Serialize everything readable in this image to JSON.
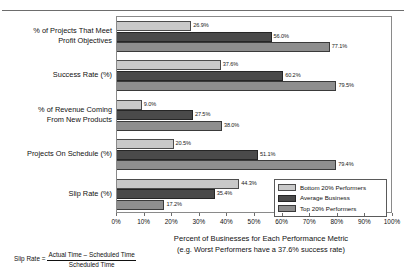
{
  "chart_data": {
    "type": "bar",
    "orientation": "horizontal",
    "title": "",
    "xlabel": "Percent of Businesses for Each Performance Metric",
    "xlabel_sub": "(e.g. Worst Performers have a 37.6% success rate)",
    "ylabel": "",
    "xlim": [
      0,
      100
    ],
    "grid": false,
    "legend_position": "inside-bottom-right",
    "categories": [
      "% of Projects That Meet\nProfit Objectives",
      "Success Rate (%)",
      "% of Revenue Coming\nFrom New Products",
      "Projects On Schedule (%)",
      "Slip Rate (%)"
    ],
    "series": [
      {
        "name": "Bottom 20% Performers",
        "color": "#c9c9c9",
        "values": [
          26.9,
          37.6,
          9.0,
          20.5,
          44.3
        ],
        "labels": [
          "26.9%",
          "37.6%",
          "9.0%",
          "20.5%",
          "44.3%"
        ]
      },
      {
        "name": "Average Business",
        "color": "#4a4a4a",
        "values": [
          56.0,
          60.2,
          27.5,
          51.1,
          35.4
        ],
        "labels": [
          "56.0%",
          "60.2%",
          "27.5%",
          "51.1%",
          "35.4%"
        ]
      },
      {
        "name": "Top 20% Performers",
        "color": "#8e8e8e",
        "values": [
          77.1,
          79.5,
          38.0,
          79.4,
          17.2
        ],
        "labels": [
          "77.1%",
          "79.5%",
          "38.0%",
          "79.4%",
          "17.2%"
        ]
      }
    ],
    "xticks": [
      0,
      10,
      20,
      30,
      40,
      50,
      60,
      70,
      80,
      90,
      100
    ],
    "xticklabels": [
      "0%",
      "10%",
      "20%",
      "30%",
      "40%",
      "50%",
      "60%",
      "70%",
      "80%",
      "90%",
      "100%"
    ]
  },
  "legend": {
    "items": [
      {
        "label": "Bottom 20% Performers"
      },
      {
        "label": "Average Business"
      },
      {
        "label": "Top 20% Performers"
      }
    ]
  },
  "footnote": {
    "lead": "Slip Rate =",
    "numerator": "Actual Time – Scheduled Time",
    "denominator": "Scheduled Time"
  }
}
